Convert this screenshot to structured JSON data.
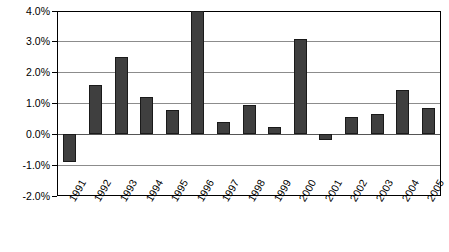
{
  "chart_data": {
    "type": "bar",
    "title": "",
    "subtitle": "",
    "xlabel": "",
    "ylabel": "",
    "categories": [
      "1991",
      "1992",
      "1993",
      "1994",
      "1995",
      "1996",
      "1997",
      "1998",
      "1999",
      "2000",
      "2001",
      "2002",
      "2003",
      "2004",
      "2005"
    ],
    "values": [
      -0.9,
      1.6,
      2.5,
      1.2,
      0.8,
      4.0,
      0.4,
      0.95,
      0.25,
      3.1,
      -0.2,
      0.55,
      0.65,
      1.45,
      0.85
    ],
    "value_unit": "%",
    "ylim": [
      -2.0,
      4.0
    ],
    "ytick_values": [
      4.0,
      3.0,
      2.0,
      1.0,
      0.0,
      -1.0,
      -2.0
    ],
    "ytick_labels": [
      "4.0%",
      "3.0%",
      "2.0%",
      "1.0%",
      "0.0%",
      "-1.0%",
      "-2.0%"
    ],
    "grid": true,
    "legend": false,
    "legend_position": "none",
    "series": [
      {
        "name": "",
        "values": [
          -0.9,
          1.6,
          2.5,
          1.2,
          0.8,
          4.0,
          0.4,
          0.95,
          0.25,
          3.1,
          -0.2,
          0.55,
          0.65,
          1.45,
          0.85
        ]
      }
    ],
    "colors": {
      "bar_fill": "#3f3f3f",
      "bar_stroke": "#1a1a1a",
      "gridline": "#8c8c8c",
      "axis": "#000000",
      "background": "#ffffff",
      "text": "#000000"
    }
  }
}
